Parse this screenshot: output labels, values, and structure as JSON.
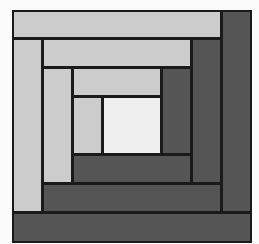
{
  "figure": {
    "title": "",
    "colors": {
      "light": "#cccccc",
      "dark": "#555555",
      "center": "#efefef",
      "outline": "#1a1a1a",
      "background": "#fbfbfb"
    },
    "blocks": [
      {
        "name": "center-square",
        "x": 102,
        "y": 96,
        "w": 60,
        "h": 59,
        "tone": "center"
      },
      {
        "name": "light-strip-1-left",
        "x": 72,
        "y": 96,
        "w": 31,
        "h": 59,
        "tone": "light"
      },
      {
        "name": "light-strip-1-top",
        "x": 72,
        "y": 67,
        "w": 90,
        "h": 30,
        "tone": "light"
      },
      {
        "name": "dark-strip-1-right",
        "x": 161,
        "y": 67,
        "w": 31,
        "h": 88,
        "tone": "dark"
      },
      {
        "name": "dark-strip-1-bottom",
        "x": 72,
        "y": 154,
        "w": 120,
        "h": 30,
        "tone": "dark"
      },
      {
        "name": "light-strip-2-left",
        "x": 42,
        "y": 67,
        "w": 31,
        "h": 117,
        "tone": "light"
      },
      {
        "name": "light-strip-2-top",
        "x": 42,
        "y": 38,
        "w": 150,
        "h": 30,
        "tone": "light"
      },
      {
        "name": "dark-strip-2-right",
        "x": 191,
        "y": 38,
        "w": 31,
        "h": 146,
        "tone": "dark"
      },
      {
        "name": "dark-strip-2-bottom",
        "x": 42,
        "y": 183,
        "w": 180,
        "h": 30,
        "tone": "dark"
      },
      {
        "name": "light-strip-3-left",
        "x": 12,
        "y": 38,
        "w": 31,
        "h": 175,
        "tone": "light"
      },
      {
        "name": "light-strip-3-top",
        "x": 12,
        "y": 10,
        "w": 210,
        "h": 29,
        "tone": "light"
      },
      {
        "name": "dark-strip-3-right",
        "x": 221,
        "y": 10,
        "w": 31,
        "h": 203,
        "tone": "dark"
      },
      {
        "name": "dark-strip-3-bottom",
        "x": 12,
        "y": 212,
        "w": 240,
        "h": 31,
        "tone": "dark"
      }
    ]
  }
}
